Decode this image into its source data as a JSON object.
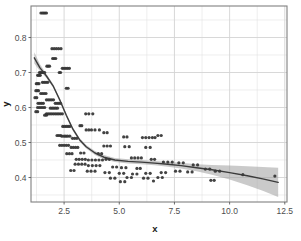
{
  "chart_data": {
    "type": "scatter",
    "title": "",
    "subtitle": "",
    "xlabel": "x",
    "ylabel": "y",
    "xlim": [
      1.0,
      12.6
    ],
    "ylim": [
      0.33,
      0.89
    ],
    "xticks": [
      2.5,
      5.0,
      7.5,
      10.0,
      12.5
    ],
    "xtick_labels": [
      "2.5",
      "5.0",
      "7.5",
      "10.0",
      "12.5"
    ],
    "yticks": [
      0.4,
      0.5,
      0.6,
      0.7,
      0.8
    ],
    "ytick_labels": [
      "0.4",
      "0.5",
      "0.6",
      "0.7",
      "0.8"
    ],
    "x_minor_ticks": [
      1.25,
      3.75,
      6.25,
      8.75,
      11.25
    ],
    "y_minor_ticks": [
      0.35,
      0.45,
      0.55,
      0.65,
      0.75,
      0.85
    ],
    "grid": true,
    "legend": "none",
    "point_color": "#333333",
    "point_size": 1.6,
    "smooth_line_color": "#3b3b3b",
    "smooth_band_color": "#9e9e9e",
    "panel_background": "#ffffff",
    "panel_border_color": "#808080",
    "grid_color": "#e3e3e3",
    "series": [
      {
        "name": "observations",
        "points": [
          [
            1.45,
            0.87
          ],
          [
            1.52,
            0.87
          ],
          [
            1.58,
            0.87
          ],
          [
            1.64,
            0.87
          ],
          [
            1.7,
            0.87
          ],
          [
            1.95,
            0.768
          ],
          [
            2.05,
            0.768
          ],
          [
            2.15,
            0.768
          ],
          [
            2.25,
            0.768
          ],
          [
            2.36,
            0.768
          ],
          [
            1.98,
            0.74
          ],
          [
            2.05,
            0.74
          ],
          [
            2.12,
            0.74
          ],
          [
            1.72,
            0.718
          ],
          [
            1.78,
            0.718
          ],
          [
            1.84,
            0.718
          ],
          [
            2.42,
            0.712
          ],
          [
            2.5,
            0.712
          ],
          [
            2.58,
            0.712
          ],
          [
            2.66,
            0.712
          ],
          [
            2.74,
            0.712
          ],
          [
            2.28,
            0.7
          ],
          [
            2.34,
            0.7
          ],
          [
            1.38,
            0.7
          ],
          [
            1.44,
            0.7
          ],
          [
            1.5,
            0.7
          ],
          [
            1.56,
            0.7
          ],
          [
            1.62,
            0.7
          ],
          [
            1.3,
            0.692
          ],
          [
            1.36,
            0.692
          ],
          [
            1.42,
            0.692
          ],
          [
            2.6,
            0.655
          ],
          [
            2.68,
            0.655
          ],
          [
            1.24,
            0.668
          ],
          [
            1.3,
            0.668
          ],
          [
            1.36,
            0.668
          ],
          [
            1.52,
            0.672
          ],
          [
            1.6,
            0.672
          ],
          [
            1.68,
            0.672
          ],
          [
            1.76,
            0.672
          ],
          [
            1.22,
            0.648
          ],
          [
            1.28,
            0.648
          ],
          [
            1.34,
            0.648
          ],
          [
            1.44,
            0.64
          ],
          [
            1.52,
            0.64
          ],
          [
            1.6,
            0.64
          ],
          [
            1.68,
            0.64
          ],
          [
            1.18,
            0.628
          ],
          [
            1.26,
            0.628
          ],
          [
            1.7,
            0.622
          ],
          [
            1.78,
            0.622
          ],
          [
            1.86,
            0.622
          ],
          [
            1.94,
            0.622
          ],
          [
            2.02,
            0.622
          ],
          [
            1.32,
            0.612
          ],
          [
            1.4,
            0.612
          ],
          [
            1.48,
            0.612
          ],
          [
            1.56,
            0.612
          ],
          [
            2.1,
            0.612
          ],
          [
            2.18,
            0.612
          ],
          [
            2.26,
            0.612
          ],
          [
            2.34,
            0.612
          ],
          [
            1.3,
            0.6
          ],
          [
            1.38,
            0.6
          ],
          [
            1.46,
            0.6
          ],
          [
            1.54,
            0.6
          ],
          [
            1.62,
            0.6
          ],
          [
            1.88,
            0.598
          ],
          [
            1.96,
            0.598
          ],
          [
            2.04,
            0.598
          ],
          [
            2.12,
            0.598
          ],
          [
            2.2,
            0.598
          ],
          [
            1.22,
            0.588
          ],
          [
            1.3,
            0.588
          ],
          [
            1.7,
            0.582
          ],
          [
            1.78,
            0.582
          ],
          [
            1.86,
            0.582
          ],
          [
            1.94,
            0.582
          ],
          [
            2.02,
            0.582
          ],
          [
            2.1,
            0.582
          ],
          [
            2.18,
            0.582
          ],
          [
            2.26,
            0.582
          ],
          [
            2.34,
            0.582
          ],
          [
            2.42,
            0.582
          ],
          [
            3.48,
            0.582
          ],
          [
            3.62,
            0.582
          ],
          [
            3.8,
            0.582
          ],
          [
            1.62,
            0.578
          ],
          [
            1.7,
            0.578
          ],
          [
            2.44,
            0.546
          ],
          [
            2.52,
            0.546
          ],
          [
            2.6,
            0.546
          ],
          [
            2.68,
            0.546
          ],
          [
            2.76,
            0.546
          ],
          [
            3.22,
            0.548
          ],
          [
            3.3,
            0.548
          ],
          [
            2.18,
            0.52
          ],
          [
            2.26,
            0.52
          ],
          [
            2.34,
            0.52
          ],
          [
            3.5,
            0.536
          ],
          [
            3.62,
            0.536
          ],
          [
            3.74,
            0.536
          ],
          [
            3.9,
            0.536
          ],
          [
            4.1,
            0.536
          ],
          [
            4.3,
            0.528
          ],
          [
            4.45,
            0.528
          ],
          [
            2.4,
            0.518
          ],
          [
            2.5,
            0.518
          ],
          [
            2.58,
            0.518
          ],
          [
            2.66,
            0.518
          ],
          [
            2.76,
            0.518
          ],
          [
            2.88,
            0.512
          ],
          [
            2.98,
            0.512
          ],
          [
            3.08,
            0.512
          ],
          [
            5.2,
            0.516
          ],
          [
            5.35,
            0.516
          ],
          [
            6.05,
            0.514
          ],
          [
            6.2,
            0.514
          ],
          [
            6.35,
            0.514
          ],
          [
            6.5,
            0.514
          ],
          [
            6.62,
            0.514
          ],
          [
            6.75,
            0.52
          ],
          [
            6.9,
            0.52
          ],
          [
            2.3,
            0.492
          ],
          [
            2.4,
            0.492
          ],
          [
            2.5,
            0.492
          ],
          [
            2.6,
            0.492
          ],
          [
            2.7,
            0.492
          ],
          [
            2.82,
            0.486
          ],
          [
            2.92,
            0.486
          ],
          [
            3.02,
            0.486
          ],
          [
            3.12,
            0.486
          ],
          [
            4.3,
            0.49
          ],
          [
            4.45,
            0.49
          ],
          [
            4.6,
            0.49
          ],
          [
            5.25,
            0.488
          ],
          [
            5.45,
            0.488
          ],
          [
            6.2,
            0.486
          ],
          [
            6.4,
            0.486
          ],
          [
            2.62,
            0.468
          ],
          [
            2.74,
            0.468
          ],
          [
            2.86,
            0.468
          ],
          [
            3.25,
            0.47
          ],
          [
            3.4,
            0.47
          ],
          [
            4.05,
            0.468
          ],
          [
            4.2,
            0.468
          ],
          [
            3.05,
            0.452
          ],
          [
            3.18,
            0.452
          ],
          [
            3.32,
            0.452
          ],
          [
            3.46,
            0.452
          ],
          [
            3.6,
            0.45
          ],
          [
            3.76,
            0.45
          ],
          [
            3.92,
            0.45
          ],
          [
            4.08,
            0.45
          ],
          [
            4.24,
            0.45
          ],
          [
            4.4,
            0.452
          ],
          [
            4.55,
            0.452
          ],
          [
            5.55,
            0.456
          ],
          [
            5.7,
            0.456
          ],
          [
            5.85,
            0.456
          ],
          [
            6.0,
            0.456
          ],
          [
            6.45,
            0.452
          ],
          [
            6.6,
            0.452
          ],
          [
            7.0,
            0.444
          ],
          [
            7.2,
            0.444
          ],
          [
            7.4,
            0.444
          ],
          [
            7.7,
            0.442
          ],
          [
            7.9,
            0.442
          ],
          [
            8.35,
            0.436
          ],
          [
            8.55,
            0.436
          ],
          [
            3.0,
            0.438
          ],
          [
            3.15,
            0.438
          ],
          [
            3.3,
            0.438
          ],
          [
            3.45,
            0.438
          ],
          [
            3.6,
            0.434
          ],
          [
            3.78,
            0.434
          ],
          [
            3.95,
            0.434
          ],
          [
            4.12,
            0.434
          ],
          [
            4.7,
            0.43
          ],
          [
            4.88,
            0.43
          ],
          [
            5.1,
            0.428
          ],
          [
            5.3,
            0.428
          ],
          [
            5.8,
            0.426
          ],
          [
            5.95,
            0.426
          ],
          [
            8.9,
            0.424
          ],
          [
            9.1,
            0.424
          ],
          [
            9.35,
            0.418
          ],
          [
            9.55,
            0.418
          ],
          [
            2.8,
            0.42
          ],
          [
            2.95,
            0.42
          ],
          [
            3.55,
            0.418
          ],
          [
            3.72,
            0.418
          ],
          [
            3.9,
            0.418
          ],
          [
            4.35,
            0.414
          ],
          [
            4.55,
            0.414
          ],
          [
            5.0,
            0.412
          ],
          [
            5.2,
            0.412
          ],
          [
            5.6,
            0.41
          ],
          [
            5.8,
            0.41
          ],
          [
            6.2,
            0.412
          ],
          [
            6.4,
            0.412
          ],
          [
            6.9,
            0.414
          ],
          [
            7.1,
            0.414
          ],
          [
            7.55,
            0.418
          ],
          [
            7.75,
            0.418
          ],
          [
            8.1,
            0.416
          ],
          [
            8.3,
            0.416
          ],
          [
            10.6,
            0.408
          ],
          [
            12.05,
            0.404
          ],
          [
            4.6,
            0.398
          ],
          [
            4.8,
            0.398
          ],
          [
            5.35,
            0.4
          ],
          [
            5.55,
            0.4
          ],
          [
            6.1,
            0.398
          ],
          [
            6.3,
            0.398
          ],
          [
            6.75,
            0.4
          ],
          [
            6.95,
            0.4
          ],
          [
            9.15,
            0.392
          ],
          [
            9.3,
            0.392
          ],
          [
            5.05,
            0.388
          ],
          [
            5.25,
            0.388
          ],
          [
            6.55,
            0.39
          ]
        ]
      }
    ],
    "smooth": {
      "method": "loess",
      "x": [
        1.15,
        1.4,
        1.7,
        2.0,
        2.3,
        2.6,
        2.9,
        3.2,
        3.5,
        3.9,
        4.3,
        4.8,
        5.4,
        6.0,
        6.6,
        7.2,
        7.8,
        8.5,
        9.2,
        10.0,
        10.8,
        11.5,
        12.2
      ],
      "y_fit": [
        0.742,
        0.714,
        0.69,
        0.662,
        0.622,
        0.578,
        0.538,
        0.508,
        0.488,
        0.47,
        0.458,
        0.45,
        0.446,
        0.444,
        0.441,
        0.438,
        0.434,
        0.428,
        0.422,
        0.414,
        0.405,
        0.396,
        0.386
      ],
      "y_lower": [
        0.726,
        0.704,
        0.684,
        0.657,
        0.617,
        0.573,
        0.533,
        0.503,
        0.483,
        0.464,
        0.452,
        0.444,
        0.44,
        0.438,
        0.435,
        0.431,
        0.426,
        0.418,
        0.408,
        0.394,
        0.378,
        0.362,
        0.344
      ],
      "y_upper": [
        0.758,
        0.724,
        0.696,
        0.667,
        0.627,
        0.583,
        0.543,
        0.513,
        0.493,
        0.476,
        0.464,
        0.456,
        0.452,
        0.45,
        0.447,
        0.445,
        0.442,
        0.438,
        0.436,
        0.434,
        0.432,
        0.43,
        0.428
      ]
    }
  }
}
